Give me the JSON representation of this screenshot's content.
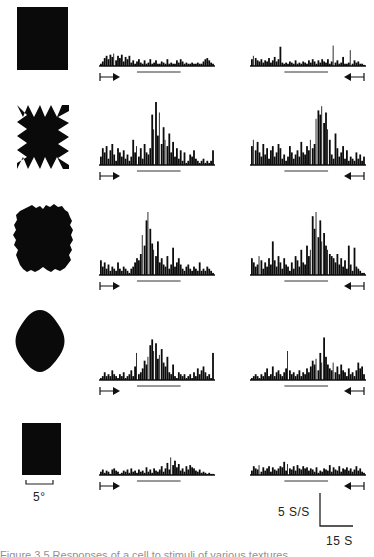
{
  "figure": {
    "scale_labels": {
      "angle": "5°",
      "rate": "5 S/S",
      "time": "15 S"
    },
    "caption_partial": "Figure 3.5 Responses of a cell to stimuli of various textures"
  },
  "chart_data": {
    "type": "bar",
    "title": "",
    "xlabel": "Time",
    "ylabel": "Firing rate",
    "scale_bars": {
      "y": "5 S/S",
      "x": "15 S",
      "stimulus_size": "5°"
    },
    "grid": false,
    "legend": null,
    "bins_per_histogram": 60,
    "rows": [
      {
        "stimulus": "solid-rectangle",
        "forward": {
          "direction": "→",
          "values": [
            2,
            4,
            7,
            9,
            6,
            10,
            8,
            11,
            5,
            9,
            7,
            10,
            4,
            8,
            6,
            9,
            3,
            5,
            2,
            4,
            6,
            3,
            2,
            5,
            2,
            3,
            6,
            2,
            3,
            5,
            2,
            2,
            4,
            3,
            2,
            6,
            2,
            3,
            2,
            2,
            5,
            3,
            6,
            4,
            2,
            3,
            2,
            2,
            3,
            2,
            2,
            3,
            2,
            2,
            4,
            6,
            7,
            5,
            3,
            2
          ],
          "max": 12
        },
        "reverse": {
          "direction": "←",
          "values": [
            6,
            9,
            7,
            5,
            4,
            6,
            3,
            5,
            4,
            7,
            3,
            5,
            8,
            4,
            6,
            17,
            3,
            2,
            3,
            2,
            4,
            3,
            2,
            5,
            2,
            3,
            2,
            4,
            3,
            2,
            5,
            3,
            6,
            4,
            2,
            5,
            3,
            6,
            4,
            3,
            6,
            2,
            4,
            18,
            3,
            5,
            2,
            3,
            8,
            2,
            2,
            3,
            14,
            2,
            5,
            3,
            4,
            2,
            2,
            1
          ],
          "max": 18
        }
      },
      {
        "stimulus": "jagged-square",
        "forward": {
          "direction": "→",
          "values": [
            4,
            8,
            6,
            9,
            3,
            7,
            10,
            5,
            2,
            8,
            6,
            4,
            7,
            3,
            5,
            2,
            4,
            12,
            6,
            9,
            4,
            8,
            3,
            10,
            6,
            5,
            8,
            24,
            17,
            30,
            14,
            25,
            10,
            18,
            12,
            9,
            15,
            6,
            11,
            4,
            8,
            3,
            7,
            2,
            6,
            1,
            2,
            5,
            4,
            7,
            3,
            2,
            1,
            2,
            3,
            1,
            2,
            1,
            2,
            7
          ],
          "max": 30
        },
        "reverse": {
          "direction": "←",
          "values": [
            9,
            12,
            7,
            11,
            6,
            4,
            10,
            5,
            8,
            3,
            7,
            9,
            4,
            6,
            10,
            8,
            3,
            5,
            2,
            4,
            9,
            6,
            3,
            5,
            7,
            4,
            11,
            6,
            5,
            9,
            7,
            12,
            8,
            10,
            22,
            26,
            24,
            28,
            20,
            25,
            17,
            12,
            5,
            3,
            15,
            8,
            4,
            6,
            9,
            3,
            7,
            2,
            4,
            3,
            2,
            6,
            3,
            5,
            2,
            4
          ],
          "max": 28
        }
      },
      {
        "stimulus": "textured-blob",
        "forward": {
          "direction": "→",
          "values": [
            7,
            4,
            6,
            3,
            5,
            2,
            4,
            3,
            2,
            6,
            3,
            2,
            4,
            3,
            2,
            1,
            3,
            4,
            6,
            8,
            7,
            10,
            19,
            14,
            26,
            30,
            22,
            15,
            12,
            9,
            16,
            6,
            8,
            5,
            4,
            9,
            3,
            5,
            13,
            4,
            6,
            8,
            5,
            3,
            2,
            4,
            5,
            3,
            2,
            4,
            3,
            2,
            6,
            2,
            3,
            2,
            4,
            3,
            2,
            1
          ],
          "max": 30
        },
        "reverse": {
          "direction": "←",
          "values": [
            8,
            6,
            4,
            5,
            9,
            7,
            3,
            6,
            4,
            8,
            5,
            16,
            7,
            4,
            9,
            6,
            3,
            8,
            5,
            4,
            2,
            6,
            3,
            9,
            7,
            4,
            12,
            6,
            5,
            14,
            9,
            12,
            28,
            22,
            30,
            18,
            26,
            16,
            20,
            14,
            12,
            10,
            9,
            8,
            6,
            10,
            5,
            8,
            4,
            7,
            3,
            14,
            5,
            2,
            13,
            4,
            3,
            2,
            1,
            1
          ],
          "max": 30
        }
      },
      {
        "stimulus": "rounded-diamond",
        "forward": {
          "direction": "→",
          "values": [
            1,
            2,
            4,
            2,
            3,
            2,
            5,
            3,
            2,
            1,
            3,
            2,
            4,
            1,
            2,
            3,
            5,
            2,
            7,
            14,
            3,
            4,
            6,
            10,
            8,
            12,
            18,
            21,
            15,
            19,
            11,
            13,
            16,
            9,
            7,
            12,
            4,
            3,
            8,
            2,
            1,
            4,
            3,
            2,
            3,
            1,
            2,
            3,
            1,
            4,
            2,
            6,
            3,
            5,
            7,
            4,
            2,
            3,
            1,
            14
          ],
          "max": 21
        },
        "reverse": {
          "direction": "←",
          "values": [
            1,
            2,
            3,
            2,
            1,
            3,
            2,
            4,
            6,
            2,
            3,
            7,
            2,
            4,
            5,
            3,
            2,
            4,
            6,
            15,
            5,
            3,
            4,
            2,
            3,
            5,
            2,
            4,
            3,
            6,
            4,
            7,
            10,
            8,
            11,
            5,
            14,
            9,
            22,
            12,
            8,
            6,
            5,
            9,
            4,
            7,
            3,
            8,
            5,
            4,
            2,
            6,
            3,
            4,
            2,
            5,
            9,
            6,
            7,
            3
          ],
          "max": 22
        }
      },
      {
        "stimulus": "small-rectangle",
        "forward": {
          "direction": "→",
          "values": [
            3,
            5,
            2,
            4,
            3,
            1,
            5,
            6,
            4,
            3,
            1,
            2,
            4,
            3,
            5,
            2,
            6,
            3,
            4,
            2,
            5,
            3,
            4,
            2,
            7,
            3,
            5,
            2,
            6,
            4,
            3,
            5,
            8,
            3,
            6,
            11,
            5,
            16,
            9,
            13,
            7,
            10,
            4,
            6,
            3,
            8,
            5,
            9,
            7,
            6,
            4,
            3,
            5,
            2,
            3,
            2,
            1,
            2,
            1,
            1
          ],
          "max": 16
        },
        "reverse": {
          "direction": "←",
          "values": [
            4,
            8,
            6,
            5,
            9,
            3,
            7,
            4,
            6,
            8,
            3,
            7,
            5,
            4,
            6,
            8,
            7,
            12,
            4,
            10,
            6,
            5,
            8,
            4,
            9,
            6,
            5,
            8,
            6,
            7,
            4,
            6,
            5,
            3,
            7,
            2,
            4,
            3,
            6,
            5,
            4,
            9,
            3,
            7,
            5,
            4,
            8,
            3,
            6,
            5,
            7,
            4,
            6,
            3,
            5,
            8,
            4,
            6,
            3,
            2
          ],
          "max": 12
        }
      }
    ]
  }
}
